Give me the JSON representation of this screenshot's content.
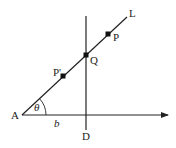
{
  "diagram": {
    "colors": {
      "stroke": "#222222",
      "point": "#111111",
      "background": "#ffffff"
    },
    "labels": {
      "L": "L",
      "P": "P",
      "Q": "Q",
      "P_prime": "P'",
      "A": "A",
      "theta": "θ",
      "b": "b",
      "D": "D"
    },
    "points": {
      "A": [
        22,
        115
      ],
      "Q": [
        86,
        55
      ],
      "P": [
        108,
        34
      ],
      "P_prime": [
        63,
        76
      ],
      "L_end": [
        127,
        17
      ],
      "axis_end": [
        168,
        115
      ],
      "D_top": [
        86,
        16
      ],
      "D_bottom": [
        86,
        130
      ]
    }
  }
}
